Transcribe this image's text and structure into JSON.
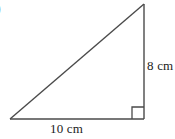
{
  "figure": {
    "kind": "right-triangle-diagram",
    "item_marker": ")",
    "background_color": "#ffffff",
    "stroke_color": "#4a4a4a",
    "text_color": "#1b1b1b",
    "labels": {
      "vertical_leg": "8 cm",
      "base_leg": "10 cm"
    },
    "right_angle_marker": "square",
    "vertices": {
      "apex": [
        144,
        4
      ],
      "bottom_left": [
        10,
        119
      ],
      "bottom_right": [
        144,
        119
      ]
    }
  }
}
